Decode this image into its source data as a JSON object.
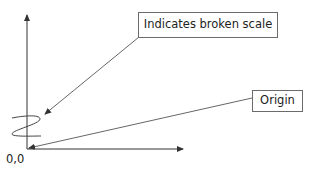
{
  "diagram": {
    "callouts": [
      {
        "id": "broken-scale",
        "label": "Indicates broken scale",
        "points_to": "zigzag break symbol on y-axis"
      },
      {
        "id": "origin",
        "label": "Origin",
        "points_to": "axes intersection"
      }
    ],
    "origin_label": "0,0",
    "axes": {
      "y_axis": {
        "direction": "up",
        "arrowhead": true,
        "has_break_symbol": true
      },
      "x_axis": {
        "direction": "right",
        "arrowhead": true
      }
    },
    "colors": {
      "line": "#333333",
      "box_border": "#6b6b6b",
      "text": "#222222",
      "background": "#ffffff"
    }
  }
}
